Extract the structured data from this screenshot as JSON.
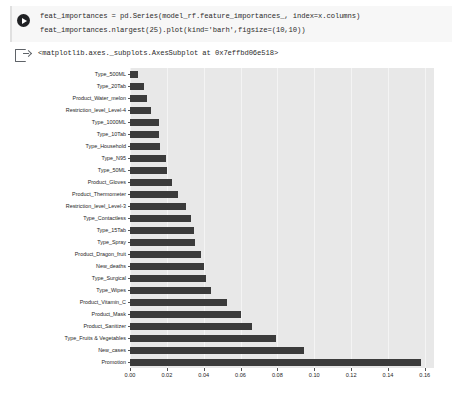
{
  "notebook": {
    "code_cell": {
      "run_icon": "run-play-icon",
      "lines": [
        "feat_importances = pd.Series(model_rf.feature_importances_, index=x.columns)",
        "feat_importances.nlargest(25).plot(kind='barh',figsize=(10,10))"
      ]
    },
    "output_cell": {
      "icon": "output-arrow-icon",
      "text": "<matplotlib.axes._subplots.AxesSubplot at 0x7effbd06e518>"
    }
  },
  "chart_data": {
    "type": "bar",
    "orientation": "horizontal",
    "title": "",
    "xlabel": "",
    "ylabel": "",
    "xlim": [
      0.0,
      0.165
    ],
    "xticks": [
      0.0,
      0.02,
      0.04,
      0.06,
      0.08,
      0.1,
      0.12,
      0.14,
      0.16
    ],
    "xtick_labels": [
      "0.00",
      "0.02",
      "0.04",
      "0.06",
      "0.08",
      "0.10",
      "0.12",
      "0.14",
      "0.16"
    ],
    "grid": true,
    "legend": false,
    "bar_color": "#3b3b3b",
    "axes_facecolor": "#e8e8e8",
    "categories": [
      "Type_500ML",
      "Type_20Tab",
      "Product_Water_melon",
      "Restriction_level_Level-4",
      "Type_1000ML",
      "Type_10Tab",
      "Type_Household",
      "Type_N95",
      "Type_50ML",
      "Product_Gloves",
      "Product_Thermometer",
      "Restriction_level_Level-3",
      "Type_Contactless",
      "Type_15Tab",
      "Type_Spray",
      "Product_Dragon_fruit",
      "New_deaths",
      "Type_Surgical",
      "Type_Wipes",
      "Product_Vitamin_C",
      "Product_Mask",
      "Product_Sanitizer",
      "Type_Fruits & Vegetables",
      "New_cases",
      "Promotion"
    ],
    "values": [
      0.0045,
      0.0075,
      0.009,
      0.0115,
      0.0155,
      0.016,
      0.0165,
      0.0195,
      0.02,
      0.023,
      0.026,
      0.0305,
      0.033,
      0.035,
      0.0355,
      0.0385,
      0.04,
      0.0415,
      0.044,
      0.0525,
      0.06,
      0.066,
      0.079,
      0.0945,
      0.158
    ]
  }
}
